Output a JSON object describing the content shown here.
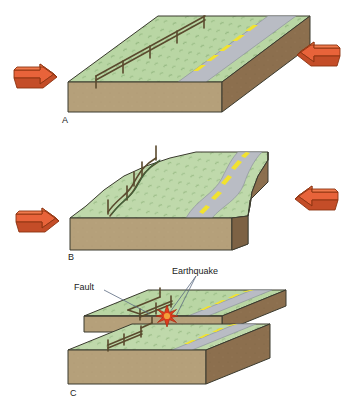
{
  "figure": {
    "background_color": "#ffffff"
  },
  "palette": {
    "grass_top": "#b9d6a4",
    "grass_top_light": "#c7ddb1",
    "soil_front": "#b5a07a",
    "soil_side": "#8c6f4e",
    "soil_side_dark": "#7d6244",
    "road_asphalt": "#b9bcc4",
    "road_line_yellow": "#f2e22e",
    "road_edge": "#8e939c",
    "arrow_fill": "#e8633a",
    "arrow_fill_light": "#f07a4d",
    "arrow_fill_dark": "#c44d28",
    "arrow_stroke": "#8c3311",
    "fence_post": "#5a4a2e",
    "fence_rail": "#6b5a38",
    "quake_star": "#e03b1c",
    "quake_star_core": "#f2a03a",
    "outline": "#3a3a2e",
    "leader_line": "#5a6a80",
    "text": "#1a1a1a",
    "grass_texture": "#6f9a5e"
  },
  "panels": [
    {
      "id": "A",
      "label": "A",
      "caption_state": "undeformed",
      "description": "Flat block with straight fence line and straight road; opposing arrows push from left and right.",
      "fence_posts": 5,
      "road_dashes": 4,
      "arrows": [
        {
          "side": "left",
          "direction": "right",
          "label": ""
        },
        {
          "side": "right",
          "direction": "left",
          "label": ""
        }
      ]
    },
    {
      "id": "B",
      "label": "B",
      "caption_state": "strained",
      "description": "Block is bent; fence line and road curve into an S shape as strain accumulates.",
      "fence_posts": 5,
      "road_dashes": 4,
      "arrows": [
        {
          "side": "left",
          "direction": "right",
          "label": ""
        },
        {
          "side": "right",
          "direction": "left",
          "label": ""
        }
      ]
    },
    {
      "id": "C",
      "label": "C",
      "caption_state": "ruptured",
      "description": "Block has broken along the fault; the two halves have slipped past each other, offsetting the fence and the road. An earthquake starburst marks the focus.",
      "fence_posts": 5,
      "road_dashes": 4,
      "arrows": [],
      "callouts": [
        {
          "name": "fault",
          "label": "Fault"
        },
        {
          "name": "earthquake",
          "label": "Earthquake"
        }
      ]
    }
  ],
  "labels": {
    "panel_a": "A",
    "panel_b": "B",
    "panel_c": "C",
    "fault": "Fault",
    "earthquake": "Earthquake"
  }
}
